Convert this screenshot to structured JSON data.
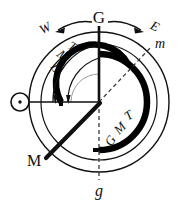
{
  "figure": {
    "kind": "astronomical-time-diagram",
    "title_text": "",
    "background_color": "#ffffff",
    "ink_color": "#101010",
    "heavy_ink_color": "#000000"
  },
  "labels": {
    "west": "W",
    "greenwich_meridian": "G",
    "east": "E",
    "local_meridian_upper": "m",
    "local_meridian_lower": "M",
    "greenwich_meridian_lower": "g",
    "lmt_arc": "LMT",
    "gmt_arc": "GMT",
    "lmt_letters": [
      "L",
      "M",
      "T"
    ],
    "gmt_letters": [
      "G",
      "M",
      "T"
    ]
  },
  "symbols": {
    "sun": "sun-symbol",
    "sun_glyph": "⊙"
  },
  "geometry": {
    "outer_circle": {
      "cx": 99,
      "cy": 102,
      "r": 70
    },
    "inner_circle": {
      "cx": 99,
      "cy": 102,
      "r": 58
    },
    "gmt_arc_radius": 48,
    "lmt_arc_radius": 38,
    "lmt_inner_arc_radius": 28,
    "sun": {
      "cx": 20,
      "cy": 102,
      "r": 9,
      "dot_r": 1.6
    },
    "center": {
      "cx": 99,
      "cy": 102
    },
    "m_direction_deg": 40,
    "M_direction_deg": 220
  },
  "directions": {
    "west_arrow": "arrow-left",
    "east_arrow": "arrow-right",
    "lmt_arrows": "two-downward-arrows"
  },
  "colors": {
    "line": "#101010",
    "heavy": "#000000",
    "dashed": "#3a3a3a"
  }
}
